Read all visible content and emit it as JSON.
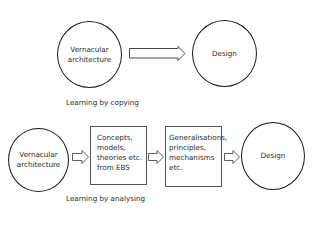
{
  "top_row": {
    "source": {
      "lines": [
        "Vernacular",
        "architecture"
      ]
    },
    "target": {
      "label": "Design"
    },
    "caption": "Learning by copying"
  },
  "bottom_row": {
    "source": {
      "lines": [
        "Vernacular",
        "architecture"
      ]
    },
    "box1": {
      "lines": [
        "Concepts,",
        "models,",
        "theories etc.",
        "from EBS"
      ]
    },
    "box2": {
      "lines": [
        "Generalisations,",
        "principles,",
        "mechanisms",
        "etc."
      ]
    },
    "target": {
      "label": "Design"
    },
    "caption": "Learning by analysing"
  },
  "colors": {
    "stroke": "#1a1a1a",
    "box_stroke": "#555555",
    "background": "#ffffff"
  }
}
